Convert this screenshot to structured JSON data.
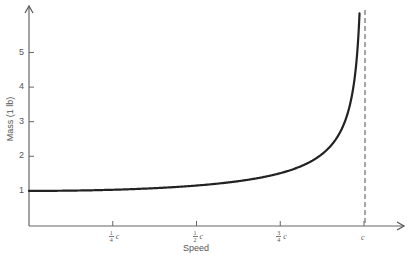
{
  "chart_data": {
    "type": "line",
    "title": "",
    "xlabel": "Speed",
    "ylabel": "Mass (1 lb)",
    "x_tick_labels": [
      {
        "num": "1",
        "den": "4",
        "sym": "c",
        "value": 0.25
      },
      {
        "num": "1",
        "den": "2",
        "sym": "c",
        "value": 0.5
      },
      {
        "num": "3",
        "den": "4",
        "sym": "c",
        "value": 0.75
      },
      {
        "num": "",
        "den": "",
        "sym": "c",
        "value": 1.0
      }
    ],
    "y_tick_labels": [
      "1",
      "2",
      "3",
      "4",
      "5"
    ],
    "y_ticks": [
      1,
      2,
      3,
      4,
      5
    ],
    "xlim": [
      0,
      1.1
    ],
    "ylim": [
      0,
      6.3
    ],
    "grid": false,
    "legend": null,
    "asymptote": {
      "x": 1.0,
      "style": "dashed",
      "label": "c"
    },
    "series": [
      {
        "name": "Mass vs speed (relativistic)",
        "formula": "m = 1 / sqrt(1 - v^2/c^2)",
        "x": [
          0,
          0.1,
          0.2,
          0.25,
          0.3,
          0.4,
          0.5,
          0.6,
          0.7,
          0.75,
          0.8,
          0.85,
          0.9,
          0.93,
          0.95,
          0.97,
          0.98,
          0.985
        ],
        "values": [
          1.0,
          1.005,
          1.021,
          1.033,
          1.048,
          1.091,
          1.155,
          1.25,
          1.4,
          1.512,
          1.667,
          1.898,
          2.294,
          2.72,
          3.203,
          4.113,
          5.025,
          5.82
        ]
      }
    ]
  }
}
